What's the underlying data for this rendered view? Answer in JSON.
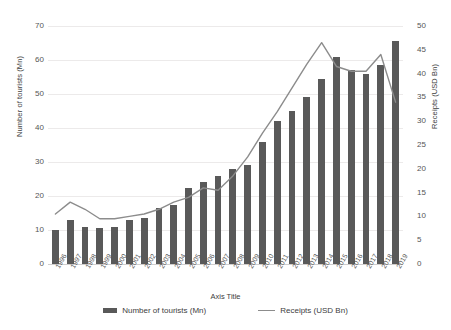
{
  "chart_data": {
    "type": "bar",
    "title": "",
    "xlabel": "Axis Title",
    "ylabel": "Number of tourists (Mn)",
    "y2label": "Receipts (USD Bn)",
    "grid": true,
    "legend_position": "bottom",
    "ylim": [
      0,
      70
    ],
    "y2lim": [
      0,
      50
    ],
    "yticks": [
      0,
      10,
      20,
      30,
      40,
      50,
      60,
      70
    ],
    "y2ticks": [
      0,
      5,
      10,
      15,
      20,
      25,
      30,
      35,
      40,
      45,
      50
    ],
    "categories": [
      "1996",
      "1997",
      "1998",
      "1999",
      "2000",
      "2001",
      "2002",
      "2003",
      "2004",
      "2005",
      "2006",
      "2007",
      "2008",
      "2009",
      "2010",
      "2011",
      "2012",
      "2013",
      "2014",
      "2015",
      "2016",
      "2017",
      "2018",
      "2019"
    ],
    "series": [
      {
        "name": "Number of tourists (Mn)",
        "type": "bar",
        "axis": "left",
        "color": "#595959",
        "values": [
          10,
          13,
          11,
          10.5,
          11,
          13,
          13.5,
          16.5,
          17.5,
          22.5,
          24,
          26,
          28,
          29,
          36,
          42,
          45,
          49,
          54.5,
          61,
          57,
          56,
          58.5,
          65.5
        ]
      },
      {
        "name": "Receipts (USD Bn)",
        "type": "line",
        "axis": "right",
        "color": "#8c8c8c",
        "values": [
          10.5,
          13,
          11.5,
          9.5,
          9.5,
          10,
          10.5,
          11.5,
          13,
          14,
          16,
          15.5,
          18.5,
          22.5,
          27.5,
          32,
          37,
          42,
          46.5,
          41.5,
          40.5,
          40.5,
          44,
          34
        ]
      }
    ]
  },
  "legend": {
    "items": [
      {
        "label": "Number of tourists (Mn)",
        "marker": "bar-swatch",
        "color": "#595959"
      },
      {
        "label": "Receipts (USD Bn)",
        "marker": "line-swatch",
        "color": "#8c8c8c"
      }
    ]
  },
  "axes": {
    "x_title": "Axis Title",
    "y_left_title": "Number of tourists (Mn)",
    "y_right_title": "Receipts (USD Bn)"
  }
}
